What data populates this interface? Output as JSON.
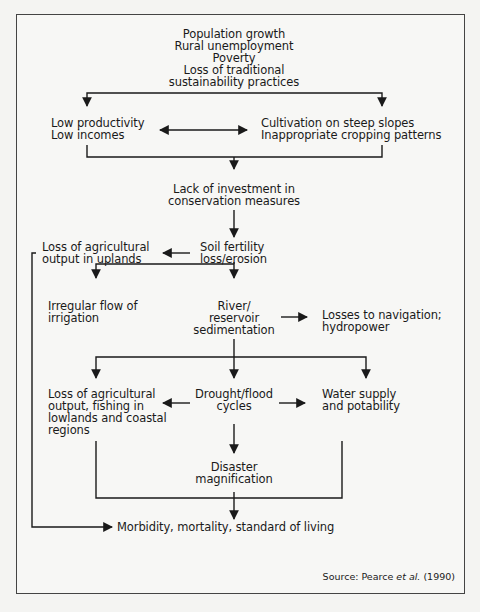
{
  "diagram": {
    "type": "flowchart",
    "nodes": {
      "root": {
        "lines": [
          "Population growth",
          "Rural unemployment",
          "Poverty",
          "Loss of traditional",
          "sustainability practices"
        ]
      },
      "low_productivity": {
        "lines": [
          "Low productivity",
          "Low incomes"
        ]
      },
      "cultivation": {
        "lines": [
          "Cultivation on steep slopes",
          "Inappropriate cropping patterns"
        ]
      },
      "lack_investment": {
        "lines": [
          "Lack of investment in",
          "conservation measures"
        ]
      },
      "soil_fertility": {
        "lines": [
          "Soil fertility",
          "loss/erosion"
        ]
      },
      "loss_uplands": {
        "lines": [
          "Loss of agricultural",
          "output in uplands"
        ]
      },
      "irregular_flow": {
        "lines": [
          "Irregular flow of",
          "irrigation"
        ]
      },
      "river_sedimentation": {
        "lines": [
          "River/",
          "reservoir",
          "sedimentation"
        ]
      },
      "losses_navigation": {
        "lines": [
          "Losses to navigation;",
          "hydropower"
        ]
      },
      "loss_lowlands": {
        "lines": [
          "Loss of agricultural",
          "output, fishing in",
          "lowlands and coastal",
          "regions"
        ]
      },
      "drought_flood": {
        "lines": [
          "Drought/flood",
          "cycles"
        ]
      },
      "water_supply": {
        "lines": [
          "Water supply",
          "and potability"
        ]
      },
      "disaster": {
        "lines": [
          "Disaster",
          "magnification"
        ]
      },
      "morbidity": {
        "lines": [
          "Morbidity, mortality, standard of living"
        ]
      }
    },
    "edges": [
      [
        "root",
        "low_productivity"
      ],
      [
        "root",
        "cultivation"
      ],
      [
        "low_productivity",
        "cultivation",
        "bidirectional"
      ],
      [
        "low_productivity",
        "lack_investment"
      ],
      [
        "cultivation",
        "lack_investment"
      ],
      [
        "lack_investment",
        "soil_fertility"
      ],
      [
        "soil_fertility",
        "loss_uplands"
      ],
      [
        "soil_fertility",
        "irregular_flow"
      ],
      [
        "soil_fertility",
        "river_sedimentation"
      ],
      [
        "river_sedimentation",
        "losses_navigation"
      ],
      [
        "river_sedimentation",
        "loss_lowlands"
      ],
      [
        "river_sedimentation",
        "drought_flood"
      ],
      [
        "river_sedimentation",
        "water_supply"
      ],
      [
        "drought_flood",
        "loss_lowlands"
      ],
      [
        "drought_flood",
        "water_supply"
      ],
      [
        "drought_flood",
        "disaster"
      ],
      [
        "loss_lowlands",
        "morbidity"
      ],
      [
        "disaster",
        "morbidity"
      ],
      [
        "water_supply",
        "morbidity"
      ],
      [
        "loss_uplands",
        "morbidity"
      ]
    ],
    "source": {
      "prefix": "Source: Pearce ",
      "italic": "et al.",
      "suffix": " (1990)"
    },
    "colors": {
      "line": "#1a1a1a",
      "frame": "#444444",
      "background": "#f7f7f5"
    }
  }
}
